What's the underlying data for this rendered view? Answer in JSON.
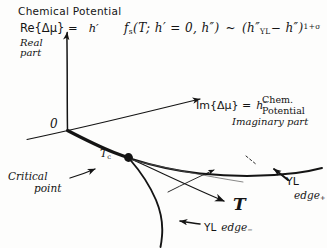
{
  "figure": {
    "title": "Chemical Potential",
    "background_color": "#fdfdfc",
    "ink_color": "#141414",
    "style": "hand-drawn sketch"
  },
  "axes": {
    "vertical": {
      "label_equation": "Re{Δμ} =",
      "label_symbol": "h′",
      "sublabel": "Real\npart",
      "sublabel_line1": "Real",
      "sublabel_line2": "part",
      "origin_label": "0"
    },
    "depth": {
      "label_equation": "Im{Δμ} =",
      "label_symbol": "h″",
      "caption_line1": "Chem.",
      "caption_line2": "Potential",
      "caption_line3": "Imaginary part"
    },
    "horizontal": {
      "label": "T"
    }
  },
  "formula": {
    "lhs": "f",
    "lhs_sub": "s",
    "args": "(T; h′ = 0, h″)",
    "relation": "~",
    "rhs_open": "(",
    "rhs_base": "h″",
    "rhs_base_sub": "YL",
    "rhs_minus": "− h″",
    "rhs_close": ")",
    "rhs_exponent": "1+σ",
    "full_text": "f_s(T; h′ = 0, h″) ~ (h″_YL − h″)^(1+σ)"
  },
  "annotations": {
    "critical_point": {
      "marker_label": "T",
      "marker_label_sub": "c",
      "caption_line1": "Critical",
      "caption_line2": "point"
    },
    "yl_edge_plus": {
      "text": "YL",
      "sub_text": "edge",
      "sub_sign": "+"
    },
    "yl_edge_minus": {
      "text": "YL",
      "sub_text": "edge",
      "sub_sign": "−"
    }
  }
}
